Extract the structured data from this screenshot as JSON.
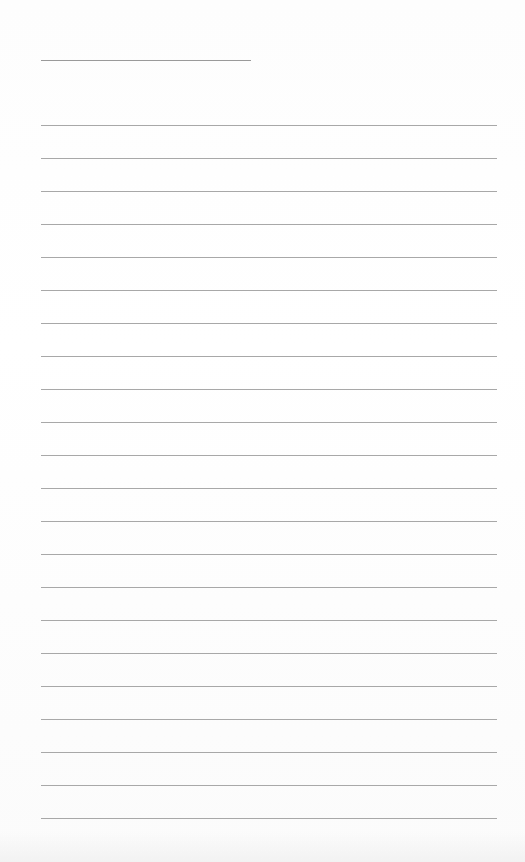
{
  "page": {
    "type": "lined-paper",
    "name_line": {
      "label": ""
    },
    "rules": {
      "count": 22,
      "first_top": 125,
      "spacing": 33,
      "left": 41,
      "width": 456
    },
    "colors": {
      "background": "#ffffff",
      "rule": "#a8a8a8",
      "name_line": "#9a9a9a"
    }
  }
}
